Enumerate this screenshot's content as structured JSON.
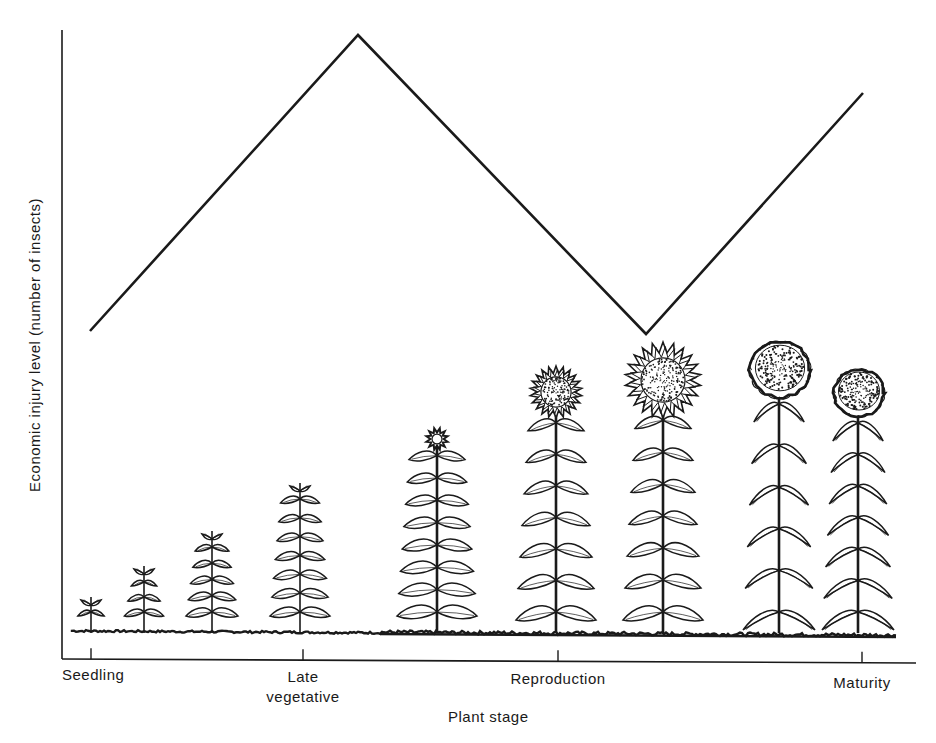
{
  "chart_data": {
    "type": "line",
    "title": "",
    "xlabel": "Plant stage",
    "ylabel": "Economic injury level  (number of insects)",
    "x_tick_labels": [
      {
        "label": "Seedling",
        "x": 91
      },
      {
        "label": "Late\nvegetative",
        "x": 303
      },
      {
        "label": "Reproduction",
        "x": 558
      },
      {
        "label": "Maturity",
        "x": 862
      }
    ],
    "categories": [
      "Seedling",
      "Late vegetative (mid)",
      "Early reproduction (bloom)",
      "Maturity"
    ],
    "series": [
      {
        "name": "Economic injury level",
        "description": "Relative EIL: moderate at seedling, peaks during vegetative growth, drops to minimum during reproduction/flowering, rises again toward maturity",
        "points_px": [
          [
            90,
            331
          ],
          [
            358,
            35
          ],
          [
            646,
            334
          ],
          [
            863,
            93
          ]
        ],
        "relative_values": [
          0.5,
          1.0,
          0.49,
          0.9
        ]
      }
    ],
    "y_ticks": [],
    "grid": false,
    "legend": "none",
    "axes": {
      "origin": [
        62,
        659
      ],
      "y_top": 30,
      "x_right": 916
    },
    "illustration": {
      "ground_y": 632,
      "ground_x": [
        72,
        896
      ],
      "plants": [
        {
          "stage": "seedling",
          "x": 91,
          "top": 597,
          "leaf_pairs": 1,
          "head": "none"
        },
        {
          "stage": "young",
          "x": 144,
          "top": 566,
          "leaf_pairs": 3,
          "head": "none"
        },
        {
          "stage": "young",
          "x": 212,
          "top": 531,
          "leaf_pairs": 5,
          "head": "none"
        },
        {
          "stage": "late vegetative",
          "x": 300,
          "top": 483,
          "leaf_pairs": 7,
          "head": "none"
        },
        {
          "stage": "bud",
          "x": 437,
          "top": 428,
          "leaf_pairs": 8,
          "head": "bud",
          "head_r": 11
        },
        {
          "stage": "flowering",
          "x": 556,
          "top": 366,
          "leaf_pairs": 7,
          "head": "flower",
          "head_r": 26
        },
        {
          "stage": "full bloom",
          "x": 663,
          "top": 342,
          "leaf_pairs": 7,
          "head": "flower",
          "head_r": 38
        },
        {
          "stage": "seed fill",
          "x": 779,
          "top": 340,
          "leaf_pairs": 6,
          "head": "mature",
          "head_r": 30
        },
        {
          "stage": "maturity",
          "x": 858,
          "top": 368,
          "leaf_pairs": 7,
          "head": "mature",
          "head_r": 25
        }
      ]
    }
  }
}
